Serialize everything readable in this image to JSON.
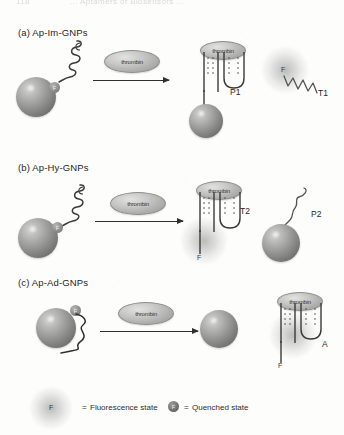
{
  "header": {
    "page_number": "118",
    "running_title": "... Aptamers of Biosensors ..."
  },
  "figure": {
    "sections": [
      {
        "id": "a",
        "label": "(a) Ap-Im-GNPs",
        "reagent_label": "thrombin",
        "product_labels": [
          "P1",
          "T1"
        ],
        "fluorophore_label": "F",
        "complex_protein_label": "thrombin"
      },
      {
        "id": "b",
        "label": "(b) Ap-Hy-GNPs",
        "reagent_label": "thrombin",
        "product_labels": [
          "T2",
          "P2"
        ],
        "fluorophore_label": "F",
        "complex_protein_label": "thrombin"
      },
      {
        "id": "c",
        "label": "(c) Ap-Ad-GNPs",
        "reagent_label": "thrombin",
        "product_labels": [
          "A"
        ],
        "fluorophore_label": "F",
        "complex_protein_label": "thrombin"
      }
    ]
  },
  "legend": {
    "fluorescence": {
      "marker_label": "F",
      "equals": "=",
      "text": "Fluorescence state"
    },
    "quenched": {
      "marker_label": "F",
      "equals": "=",
      "text": "Quenched state"
    }
  },
  "colors": {
    "paper": "#fdfdfc",
    "ink": "#2b2b2b",
    "nanoparticle": "#8a8a88",
    "protein": "#c3c3c1"
  }
}
